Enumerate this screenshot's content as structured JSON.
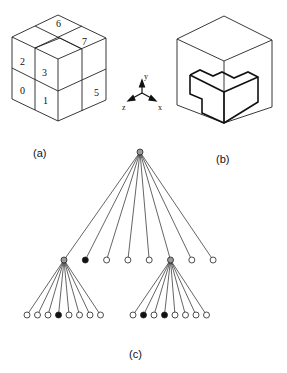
{
  "panel_a": {
    "label": "(a)",
    "cells": [
      {
        "id": "0",
        "text": "0"
      },
      {
        "id": "1",
        "text": "1"
      },
      {
        "id": "2",
        "text": "2"
      },
      {
        "id": "3",
        "text": "3"
      },
      {
        "id": "5",
        "text": "5"
      },
      {
        "id": "6",
        "text": "6"
      },
      {
        "id": "7",
        "text": "7"
      }
    ]
  },
  "axes": {
    "x_label": "x",
    "y_label": "y",
    "z_label": "z"
  },
  "panel_b": {
    "label": "(b)"
  },
  "panel_c": {
    "label": "(c)",
    "tree": {
      "root": {
        "state": "gray"
      },
      "level1": [
        "gray",
        "black",
        "white",
        "white",
        "white",
        "gray",
        "white",
        "white"
      ],
      "left_children": [
        "white",
        "white",
        "white",
        "black",
        "white",
        "white",
        "white",
        "white"
      ],
      "right_children": [
        "white",
        "black",
        "white",
        "black",
        "white",
        "white",
        "white",
        "white"
      ]
    }
  },
  "colors": {
    "line": "#222222",
    "gray_node": "#9a9a9a",
    "black_node": "#111111",
    "white_node": "#ffffff"
  }
}
